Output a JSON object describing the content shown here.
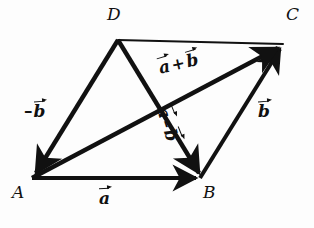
{
  "figure": {
    "type": "geometry-vector-diagram",
    "width": 314,
    "height": 228,
    "background_color": "#fdfdfd",
    "stroke_color": "#111111"
  },
  "vertices": [
    {
      "name": "A",
      "label": "A",
      "x": 32,
      "y": 178,
      "label_x": 12,
      "label_y": 186
    },
    {
      "name": "B",
      "label": "B",
      "x": 200,
      "y": 178,
      "label_x": 203,
      "label_y": 186
    },
    {
      "name": "C",
      "label": "C",
      "x": 283,
      "y": 44,
      "label_x": 286,
      "label_y": 8
    },
    {
      "name": "D",
      "label": "D",
      "x": 118,
      "y": 40,
      "label_x": 108,
      "label_y": 8
    }
  ],
  "edges": [
    {
      "name": "A-to-B",
      "from": "A",
      "to": "B",
      "arrow": true,
      "thick": true,
      "label": "a"
    },
    {
      "name": "B-to-C",
      "from": "B",
      "to": "C",
      "arrow": true,
      "thick": true,
      "label": "b"
    },
    {
      "name": "D-to-A",
      "from": "D",
      "to": "A",
      "arrow": true,
      "thick": true,
      "label": "-b"
    },
    {
      "name": "D-to-C",
      "from": "D",
      "to": "C",
      "arrow": false,
      "thick": false,
      "label": ""
    },
    {
      "name": "A-to-C",
      "from": "A",
      "to": "C",
      "arrow": true,
      "thick": true,
      "label": "a + b"
    },
    {
      "name": "D-to-B",
      "from": "D",
      "to": "B",
      "arrow": true,
      "thick": true,
      "label": "a - b"
    }
  ],
  "labels": {
    "vec_a": {
      "text": "a",
      "desc": "vector a along A to B"
    },
    "vec_b": {
      "text": "b",
      "desc": "vector b along B to C"
    },
    "vec_minus_b": {
      "sign": "–",
      "text": "b",
      "desc": "vector minus b along D to A"
    },
    "vec_sum": {
      "left": "a",
      "op": "+",
      "right": "b",
      "desc": "vector a plus b along A to C"
    },
    "vec_diff": {
      "left": "a",
      "op": "–",
      "right": "b",
      "desc": "vector a minus b along D to B"
    }
  }
}
